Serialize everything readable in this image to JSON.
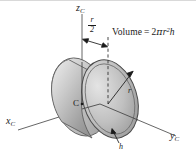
{
  "figure": {
    "kind": "engineering-solid-of-revolution-diagram",
    "background_color": "#ffffff",
    "line_color": "#1a1a1a",
    "shading": {
      "body_light": "#e8e8e8",
      "body_mid": "#bdbdbd",
      "body_dark": "#8e8e8e",
      "face_light": "#dcdcdc",
      "face_dark": "#9a9a9a"
    },
    "axes": {
      "x": {
        "label_base": "x",
        "label_sub": "C"
      },
      "y": {
        "label_base": "y",
        "label_sub": "C"
      },
      "z": {
        "label_base": "z",
        "label_sub": "C"
      }
    },
    "annotations": {
      "center_point": "C",
      "radius": "r",
      "thickness": "h",
      "half_radius_numerator": "r",
      "half_radius_denominator": "2"
    },
    "formula": {
      "lhs": "Volume",
      "equals": "=",
      "coefficient": "2",
      "pi": "π",
      "radius_symbol": "r",
      "radius_exponent": "2",
      "thickness_symbol": "h"
    }
  }
}
